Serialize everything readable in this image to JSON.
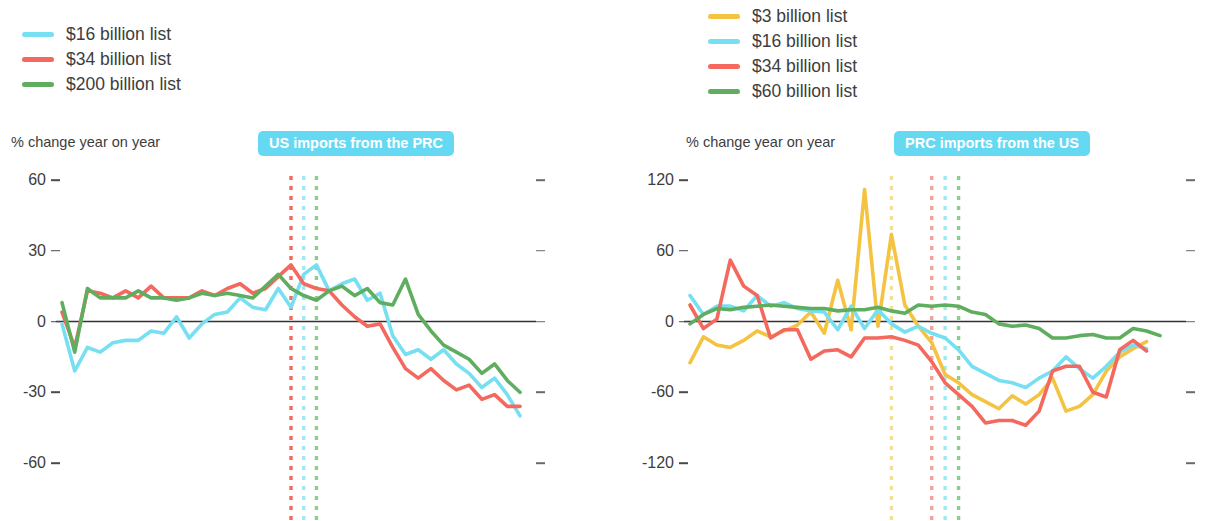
{
  "panels": [
    {
      "id": "us-imports",
      "badge": "US imports from the PRC",
      "badge_color": "#66D9F2",
      "ylabel": "% change year on year",
      "legend": [
        {
          "label": "$16 billion list",
          "color": "#76DFF2"
        },
        {
          "label": "$34 billion list",
          "color": "#F4685E"
        },
        {
          "label": "$200 billion list",
          "color": "#5FAE5F"
        }
      ]
    },
    {
      "id": "prc-imports",
      "badge": "PRC imports from the US",
      "badge_color": "#66D9F2",
      "ylabel": "% change year on year",
      "legend": [
        {
          "label": "$3 billion list",
          "color": "#F5C342"
        },
        {
          "label": "$16 billion list",
          "color": "#76DFF2"
        },
        {
          "label": "$34 billion list",
          "color": "#F4685E"
        },
        {
          "label": "$60 billion list",
          "color": "#5FAE5F"
        }
      ]
    }
  ],
  "chart_data": [
    {
      "type": "line",
      "title": "US imports from the PRC",
      "subtitle": "",
      "xlabel": "",
      "ylabel": "% change year on year",
      "ylim": [
        -60,
        60
      ],
      "yticks": [
        60,
        30,
        0,
        -30,
        -60
      ],
      "ytick_labels": [
        "60",
        "30",
        "0",
        "-30",
        "-60"
      ],
      "grid": false,
      "zero_line": true,
      "legend_position": "top-left",
      "x": [
        "2017-01",
        "2017-02",
        "2017-03",
        "2017-04",
        "2017-05",
        "2017-06",
        "2017-07",
        "2017-08",
        "2017-09",
        "2017-10",
        "2017-11",
        "2017-12",
        "2018-01",
        "2018-02",
        "2018-03",
        "2018-04",
        "2018-05",
        "2018-06",
        "2018-07",
        "2018-08",
        "2018-09",
        "2018-10",
        "2018-11",
        "2018-12",
        "2019-01",
        "2019-02",
        "2019-03",
        "2019-04",
        "2019-05",
        "2019-06"
      ],
      "xtick_labels": [
        "Jan",
        "Jul",
        "Jan",
        "Jul",
        "Jan",
        "Jun"
      ],
      "xtick_years": [
        "2017",
        "",
        "2018",
        "",
        "2019",
        ""
      ],
      "xtick_index": [
        0,
        6,
        12,
        18,
        24,
        29
      ],
      "series": [
        {
          "name": "$16 billion list",
          "color": "#76DFF2",
          "values": [
            -1,
            -21,
            -11,
            -13,
            -9,
            -8,
            -8,
            -4,
            -5,
            2,
            -7,
            -1,
            3,
            4,
            10,
            6,
            5,
            14,
            6,
            20,
            24,
            13,
            16,
            18,
            9,
            12,
            -6,
            -14,
            -12,
            -16,
            -12,
            -18,
            -22,
            -28,
            -24,
            -31,
            -40
          ]
        },
        {
          "name": "$34 billion list",
          "color": "#F4685E",
          "values": [
            4,
            -11,
            13,
            12,
            10,
            13,
            10,
            15,
            10,
            10,
            10,
            13,
            11,
            14,
            16,
            12,
            14,
            19,
            24,
            16,
            14,
            13,
            7,
            2,
            -2,
            -1,
            -11,
            -20,
            -24,
            -20,
            -25,
            -29,
            -27,
            -33,
            -31,
            -36,
            -36
          ]
        },
        {
          "name": "$200 billion list",
          "color": "#5FAE5F",
          "values": [
            8,
            -13,
            14,
            10,
            10,
            10,
            13,
            10,
            10,
            9,
            10,
            12,
            11,
            12,
            11,
            10,
            15,
            20,
            14,
            11,
            9,
            13,
            15,
            11,
            14,
            8,
            7,
            18,
            3,
            -4,
            -10,
            -13,
            -16,
            -22,
            -18,
            -25,
            -30
          ]
        }
      ],
      "event_lines": [
        {
          "at": "2018-07",
          "color": "#F4685E"
        },
        {
          "at": "2018-08",
          "color": "#9FE8F5"
        },
        {
          "at": "2018-09",
          "color": "#8FCC8F"
        }
      ]
    },
    {
      "type": "line",
      "title": "PRC imports from the US",
      "subtitle": "",
      "xlabel": "",
      "ylabel": "% change year on year",
      "ylim": [
        -120,
        120
      ],
      "yticks": [
        120,
        60,
        0,
        -60,
        -120
      ],
      "ytick_labels": [
        "120",
        "60",
        "0",
        "-60",
        "-120"
      ],
      "grid": false,
      "zero_line": true,
      "legend_position": "top-left",
      "x": [
        "2017-01",
        "2017-02",
        "2017-03",
        "2017-04",
        "2017-05",
        "2017-06",
        "2017-07",
        "2017-08",
        "2017-09",
        "2017-10",
        "2017-11",
        "2017-12",
        "2018-01",
        "2018-02",
        "2018-03",
        "2018-04",
        "2018-05",
        "2018-06",
        "2018-07",
        "2018-08",
        "2018-09",
        "2018-10",
        "2018-11",
        "2018-12",
        "2019-01",
        "2019-02",
        "2019-03",
        "2019-04",
        "2019-05",
        "2019-06"
      ],
      "xtick_labels": [
        "Jan",
        "Jul",
        "Jan",
        "Jul",
        "Jan",
        "Jun"
      ],
      "xtick_years": [
        "2017",
        "",
        "2018",
        "",
        "2019",
        ""
      ],
      "xtick_index": [
        0,
        6,
        12,
        18,
        24,
        29
      ],
      "series": [
        {
          "name": "$3 billion list",
          "color": "#F5C342",
          "values": [
            -35,
            -13,
            -20,
            -22,
            -16,
            -8,
            -13,
            -8,
            -3,
            8,
            -10,
            35,
            -7,
            112,
            -4,
            74,
            14,
            -4,
            -18,
            -45,
            -52,
            -62,
            -68,
            -74,
            -63,
            -70,
            -62,
            -48,
            -76,
            -72,
            -62,
            -42,
            -30,
            -23,
            -17
          ]
        },
        {
          "name": "$16 billion list",
          "color": "#76DFF2",
          "values": [
            22,
            6,
            13,
            13,
            9,
            22,
            13,
            16,
            11,
            9,
            8,
            -7,
            13,
            -6,
            10,
            -2,
            -9,
            -4,
            -10,
            -14,
            -24,
            -38,
            -44,
            -50,
            -52,
            -56,
            -48,
            -42,
            -30,
            -40,
            -48,
            -38,
            -26,
            -20,
            -23
          ]
        },
        {
          "name": "$34 billion list",
          "color": "#F4685E",
          "values": [
            14,
            -6,
            2,
            52,
            30,
            22,
            -14,
            -7,
            -7,
            -32,
            -25,
            -24,
            -30,
            -14,
            -14,
            -13,
            -16,
            -20,
            -34,
            -52,
            -62,
            -72,
            -86,
            -84,
            -84,
            -88,
            -76,
            -42,
            -38,
            -38,
            -60,
            -64,
            -24,
            -16,
            -25
          ]
        },
        {
          "name": "$60 billion list",
          "color": "#5FAE5F",
          "values": [
            -2,
            6,
            11,
            10,
            12,
            13,
            14,
            13,
            12,
            11,
            11,
            9,
            10,
            10,
            12,
            9,
            7,
            14,
            13,
            14,
            13,
            8,
            6,
            -2,
            -4,
            -3,
            -6,
            -14,
            -14,
            -12,
            -11,
            -14,
            -14,
            -6,
            -8,
            -12
          ]
        }
      ],
      "event_lines": [
        {
          "at": "2018-04",
          "color": "#F5DF90"
        },
        {
          "at": "2018-07",
          "color": "#F4A39A"
        },
        {
          "at": "2018-08",
          "color": "#9FE8F5"
        },
        {
          "at": "2018-09",
          "color": "#8FCC8F"
        }
      ]
    }
  ]
}
